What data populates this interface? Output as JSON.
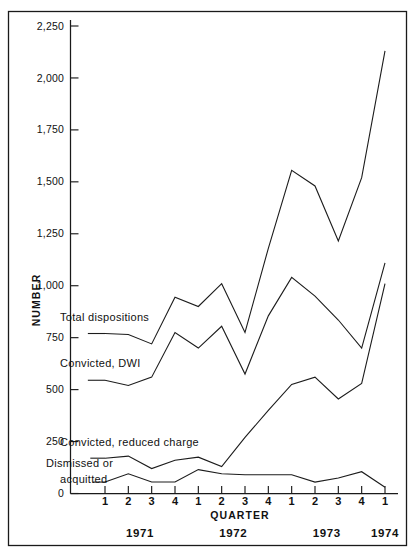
{
  "figure": {
    "frame_present": true,
    "background_color": "#ffffff",
    "line_color": "#1c1c1c"
  },
  "chart_data": {
    "type": "line",
    "title": "",
    "xlabel": "QUARTER",
    "ylabel": "NUMBER",
    "ylim": [
      0,
      2250
    ],
    "yticks": [
      0,
      250,
      500,
      750,
      1000,
      1250,
      1500,
      1750,
      2000,
      2250
    ],
    "ytick_labels": [
      "0",
      "250",
      "500",
      "750",
      "1,000",
      "1,250",
      "1,500",
      "1,750",
      "2,000",
      "2,250"
    ],
    "grid": false,
    "legend_position": "inline-labels",
    "x": [
      "1971 Q1",
      "1971 Q2",
      "1971 Q3",
      "1971 Q4",
      "1972 Q1",
      "1972 Q2",
      "1972 Q3",
      "1972 Q4",
      "1973 Q1",
      "1973 Q2",
      "1973 Q3",
      "1973 Q4",
      "1974 Q1"
    ],
    "xtick_labels": [
      "1",
      "2",
      "3",
      "4",
      "1",
      "2",
      "3",
      "4",
      "1",
      "2",
      "3",
      "4",
      "1"
    ],
    "year_groups": [
      {
        "label": "1971",
        "start_index": 0,
        "end_index": 3
      },
      {
        "label": "1972",
        "start_index": 4,
        "end_index": 7
      },
      {
        "label": "1973",
        "start_index": 8,
        "end_index": 11
      },
      {
        "label": "1974",
        "start_index": 12,
        "end_index": 12
      }
    ],
    "series": [
      {
        "name": "Total dispositions",
        "label_x_index": 0.35,
        "values": [
          770,
          765,
          720,
          945,
          900,
          1010,
          775,
          1180,
          1555,
          1480,
          1215,
          1520,
          2130
        ]
      },
      {
        "name": "Convicted, DWI",
        "label_x_index": 0.35,
        "values": [
          545,
          520,
          560,
          775,
          700,
          805,
          575,
          855,
          1040,
          950,
          835,
          700,
          1110
        ]
      },
      {
        "name": "Convicted, reduced charge",
        "label_x_index": 0.3,
        "values": [
          170,
          180,
          120,
          160,
          175,
          130,
          270,
          400,
          525,
          560,
          455,
          530,
          1010
        ]
      },
      {
        "name": "Dismissed or acquitted",
        "label_x_index": 0.25,
        "values": [
          55,
          95,
          55,
          55,
          115,
          95,
          90,
          90,
          90,
          55,
          75,
          105,
          30
        ]
      }
    ]
  },
  "annotations": {
    "total_dispositions": "Total dispositions",
    "convicted_dwi": "Convicted, DWI",
    "convicted_reduced": "Convicted, reduced  charge",
    "dismissed_line1": "Dismissed  or",
    "dismissed_line2": "acquitted"
  },
  "axis": {
    "y_title": "NUMBER",
    "x_title": "QUARTER"
  }
}
